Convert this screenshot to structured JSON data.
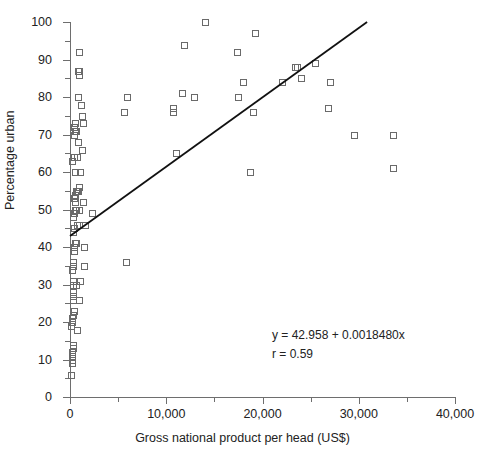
{
  "chart_data": {
    "type": "scatter",
    "title": "",
    "xlabel": "Gross national product per head (US$)",
    "ylabel": "Percentage urban",
    "xlim": [
      0,
      40000
    ],
    "ylim": [
      0,
      100
    ],
    "grid": false,
    "legend": null,
    "x_major_ticks": [
      0,
      10000,
      20000,
      30000,
      40000
    ],
    "x_tick_labels": [
      "0",
      "10,000",
      "20,000",
      "30,000",
      "40,000"
    ],
    "x_minor_ticks": [
      5000,
      15000,
      25000,
      35000
    ],
    "y_major_ticks": [
      0,
      10,
      20,
      30,
      40,
      50,
      60,
      70,
      80,
      90,
      100
    ],
    "y_tick_labels": [
      "0",
      "10",
      "20",
      "30",
      "40",
      "50",
      "60",
      "70",
      "80",
      "90",
      "100"
    ],
    "y_minor_ticks": [
      5,
      15,
      25,
      35,
      45,
      55,
      65,
      75,
      85,
      95
    ],
    "marker": "open-square",
    "marker_color": "#6a6a6a",
    "line_color": "#111111",
    "points": [
      [
        150,
        6
      ],
      [
        200,
        9
      ],
      [
        210,
        10
      ],
      [
        230,
        11
      ],
      [
        240,
        12
      ],
      [
        260,
        13
      ],
      [
        300,
        14
      ],
      [
        150,
        19
      ],
      [
        190,
        20
      ],
      [
        200,
        20
      ],
      [
        230,
        21
      ],
      [
        300,
        22
      ],
      [
        420,
        23
      ],
      [
        700,
        18
      ],
      [
        260,
        26
      ],
      [
        280,
        27
      ],
      [
        300,
        27
      ],
      [
        330,
        28
      ],
      [
        260,
        30
      ],
      [
        300,
        30
      ],
      [
        350,
        31
      ],
      [
        650,
        30
      ],
      [
        1000,
        31
      ],
      [
        900,
        26
      ],
      [
        200,
        34
      ],
      [
        260,
        35
      ],
      [
        280,
        35
      ],
      [
        330,
        36
      ],
      [
        1500,
        35
      ],
      [
        5800,
        36
      ],
      [
        380,
        39
      ],
      [
        420,
        40
      ],
      [
        500,
        41
      ],
      [
        560,
        41
      ],
      [
        620,
        41
      ],
      [
        1500,
        40
      ],
      [
        300,
        44
      ],
      [
        450,
        45
      ],
      [
        700,
        46
      ],
      [
        900,
        46
      ],
      [
        1600,
        46
      ],
      [
        350,
        48
      ],
      [
        420,
        49
      ],
      [
        480,
        50
      ],
      [
        520,
        50
      ],
      [
        560,
        50
      ],
      [
        650,
        50
      ],
      [
        900,
        50
      ],
      [
        2300,
        49
      ],
      [
        520,
        52
      ],
      [
        1300,
        52
      ],
      [
        560,
        54
      ],
      [
        620,
        55
      ],
      [
        700,
        55
      ],
      [
        800,
        55
      ],
      [
        900,
        56
      ],
      [
        420,
        53
      ],
      [
        480,
        54
      ],
      [
        500,
        60
      ],
      [
        1000,
        60
      ],
      [
        18700,
        60
      ],
      [
        200,
        63
      ],
      [
        420,
        64
      ],
      [
        700,
        64
      ],
      [
        1200,
        66
      ],
      [
        11000,
        65
      ],
      [
        800,
        68
      ],
      [
        400,
        70
      ],
      [
        520,
        71
      ],
      [
        620,
        71
      ],
      [
        420,
        72
      ],
      [
        480,
        73
      ],
      [
        500,
        73
      ],
      [
        1400,
        73
      ],
      [
        1200,
        75
      ],
      [
        1100,
        78
      ],
      [
        800,
        80
      ],
      [
        17500,
        80
      ],
      [
        11600,
        81
      ],
      [
        5900,
        80
      ],
      [
        10700,
        77
      ],
      [
        10700,
        76
      ],
      [
        12900,
        80
      ],
      [
        26800,
        77
      ],
      [
        5600,
        76
      ],
      [
        19000,
        76
      ],
      [
        22000,
        84
      ],
      [
        18000,
        84
      ],
      [
        27000,
        84
      ],
      [
        24000,
        85
      ],
      [
        900,
        86
      ],
      [
        800,
        87
      ],
      [
        900,
        87
      ],
      [
        25500,
        89
      ],
      [
        17300,
        92
      ],
      [
        900,
        92
      ],
      [
        11800,
        94
      ],
      [
        19200,
        97
      ],
      [
        14000,
        100
      ],
      [
        33600,
        61
      ],
      [
        23400,
        88
      ],
      [
        23600,
        88
      ],
      [
        33600,
        70
      ],
      [
        29500,
        70
      ]
    ],
    "regression": {
      "equation_text": "y = 42.958 + 0.0018480x",
      "correlation_text": "r = 0.59",
      "intercept": 42.958,
      "slope": 0.001848,
      "r": 0.59,
      "x_start": 0,
      "x_end": 30867
    }
  }
}
